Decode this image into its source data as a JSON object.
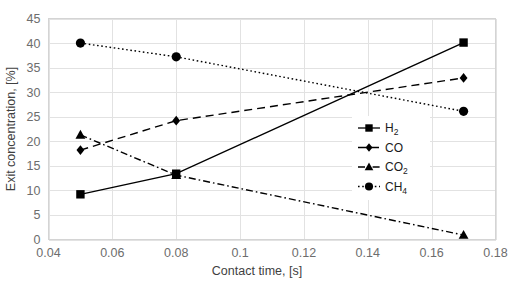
{
  "chart_data": {
    "type": "line",
    "title": "",
    "xlabel": "Contact time, [s]",
    "ylabel": "Exit concentration, [%]",
    "xlim": [
      0.04,
      0.18
    ],
    "ylim": [
      0,
      45
    ],
    "xticks": [
      "0.04",
      "0.06",
      "0.08",
      "0.1",
      "0.12",
      "0.14",
      "0.16",
      "0.18"
    ],
    "xtick_values": [
      0.04,
      0.06,
      0.08,
      0.1,
      0.12,
      0.14,
      0.16,
      0.18
    ],
    "yticks": [
      "0",
      "5",
      "10",
      "15",
      "20",
      "25",
      "30",
      "35",
      "40",
      "45"
    ],
    "ytick_values": [
      0,
      5,
      10,
      15,
      20,
      25,
      30,
      35,
      40,
      45
    ],
    "grid": true,
    "grid_axis": "both",
    "legend_position": "center-right inside plot",
    "x": [
      0.05,
      0.08,
      0.17
    ],
    "series": [
      {
        "name": "H2",
        "label": "H₂",
        "values": [
          9.2,
          13.4,
          40.1
        ],
        "marker": "square",
        "linestyle": "solid",
        "color": "#000000"
      },
      {
        "name": "CO",
        "label": "CO",
        "values": [
          18.2,
          24.2,
          32.9
        ],
        "marker": "diamond",
        "linestyle": "dashed",
        "color": "#000000"
      },
      {
        "name": "CO2",
        "label": "CO₂",
        "values": [
          21.3,
          13.1,
          0.9
        ],
        "marker": "triangle",
        "linestyle": "dashdot",
        "color": "#000000"
      },
      {
        "name": "CH4",
        "label": "CH₄",
        "values": [
          40.0,
          37.2,
          26.1
        ],
        "marker": "circle",
        "linestyle": "dotted",
        "color": "#000000"
      }
    ],
    "legend": [
      {
        "label_main": "H",
        "label_sub": "2",
        "marker": "square",
        "linestyle": "solid"
      },
      {
        "label_main": "CO",
        "label_sub": "",
        "marker": "diamond",
        "linestyle": "dashed"
      },
      {
        "label_main": "CO",
        "label_sub": "2",
        "marker": "triangle",
        "linestyle": "dashdot"
      },
      {
        "label_main": "CH",
        "label_sub": "4",
        "marker": "circle",
        "linestyle": "dotted"
      }
    ]
  },
  "colors": {
    "background": "#ffffff",
    "grid": "#e2e2e2",
    "axis": "#c9c9c9",
    "tick_text": "#6d6d6d",
    "title_text": "#3f3f3f",
    "series": "#000000"
  }
}
